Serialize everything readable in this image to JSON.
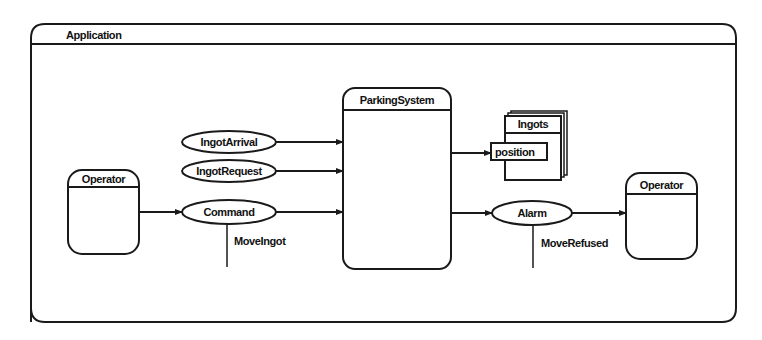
{
  "diagram": {
    "container": {
      "label": "Application"
    },
    "nodes": {
      "operator_left": {
        "label": "Operator",
        "type": "actor-box"
      },
      "parking_system": {
        "label": "ParkingSystem",
        "type": "process-box"
      },
      "ingots": {
        "label": "Ingots",
        "type": "data-store-stack"
      },
      "position": {
        "label": "position",
        "type": "attribute"
      },
      "operator_right": {
        "label": "Operator",
        "type": "actor-box"
      }
    },
    "flows": {
      "ingot_arrival": {
        "label": "IngotArrival",
        "from": "",
        "to": "ParkingSystem"
      },
      "ingot_request": {
        "label": "IngotRequest",
        "from": "",
        "to": "ParkingSystem"
      },
      "command": {
        "label": "Command",
        "from": "Operator",
        "to": "ParkingSystem",
        "subtype": "MoveIngot"
      },
      "alarm": {
        "label": "Alarm",
        "from": "ParkingSystem",
        "to": "Operator",
        "subtype": "MoveRefused"
      }
    },
    "edges": [
      {
        "from": "IngotArrival",
        "to": "ParkingSystem"
      },
      {
        "from": "IngotRequest",
        "to": "ParkingSystem"
      },
      {
        "from": "Operator",
        "to": "Command"
      },
      {
        "from": "Command",
        "to": "ParkingSystem"
      },
      {
        "from": "ParkingSystem",
        "to": "position"
      },
      {
        "from": "ParkingSystem",
        "to": "Alarm"
      },
      {
        "from": "Alarm",
        "to": "Operator"
      }
    ],
    "colors": {
      "stroke": "#1a1a1a",
      "background": "#ffffff"
    }
  }
}
